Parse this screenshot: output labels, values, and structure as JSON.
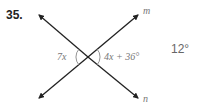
{
  "problem": {
    "number": "35.",
    "answer": "12°"
  },
  "diagram": {
    "lines": [
      {
        "name": "m",
        "label": "m"
      },
      {
        "name": "n",
        "label": "n"
      }
    ],
    "angles": [
      {
        "position": "left",
        "expression": "7x"
      },
      {
        "position": "right",
        "expression": "4x + 36°"
      }
    ],
    "colors": {
      "line": "#222222",
      "label": "#777777",
      "arc": "#888888"
    }
  }
}
